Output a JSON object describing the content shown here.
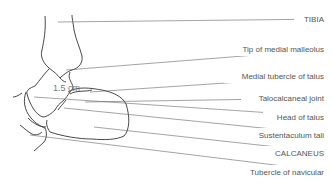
{
  "diagram": {
    "measurement": "1.5 cm",
    "labels": [
      {
        "text": "TIBIA",
        "y": 19
      },
      {
        "text": "Tip of medial malleolus",
        "y": 49
      },
      {
        "text": "Medial tubercle of talus",
        "y": 76
      },
      {
        "text": "Talocalcaneal joint",
        "y": 98
      },
      {
        "text": "Head of talus",
        "y": 117
      },
      {
        "text": "Sustentaculum tali",
        "y": 135
      },
      {
        "text": "CALCANEUS",
        "y": 153
      },
      {
        "text": "Tubercle of navicular",
        "y": 172
      }
    ]
  }
}
